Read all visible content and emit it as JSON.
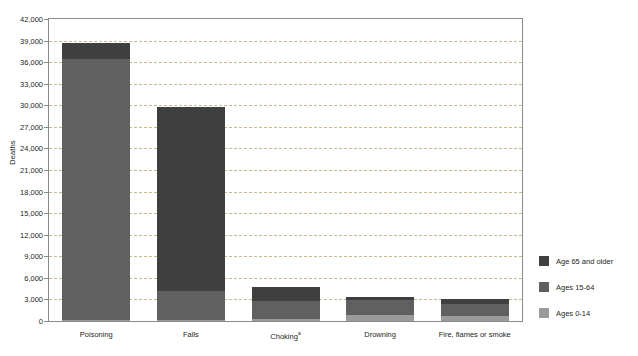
{
  "chart_data": {
    "type": "bar",
    "subtype": "stacked-vertical",
    "title": "",
    "xlabel": "",
    "ylabel": "Deaths",
    "ylim": [
      0,
      42000
    ],
    "ytick_step": 3000,
    "ytick_labels": [
      "0",
      "3,000",
      "6,000",
      "9,000",
      "12,000",
      "15,000",
      "18,000",
      "21,000",
      "24,000",
      "27,000",
      "30,000",
      "33,000",
      "36,000",
      "39,000",
      "42,000"
    ],
    "grid": true,
    "grid_axis": "y",
    "grid_style": "dashed",
    "legend_position": "right",
    "categories": [
      "Poisoning",
      "Falls",
      "Choking",
      "Drowning",
      "Fire, flames or smoke"
    ],
    "category_footnotes": [
      "",
      "",
      "a",
      "",
      ""
    ],
    "series": [
      {
        "name": "Ages 0-14",
        "color": "#9a9a9a",
        "values": [
          150,
          100,
          250,
          900,
          700
        ]
      },
      {
        "name": "Ages 15-64",
        "color": "#606060",
        "values": [
          36250,
          4100,
          2550,
          2000,
          1650
        ]
      },
      {
        "name": "Age 65 and older",
        "color": "#3f3f3f",
        "values": [
          2300,
          25500,
          2000,
          500,
          750
        ]
      }
    ],
    "totals": [
      38700,
      29700,
      4800,
      3400,
      3100
    ]
  },
  "axis": {
    "y_title": "Deaths"
  },
  "legend": {
    "items": [
      {
        "label": "Age 65 and older",
        "color": "#3f3f3f"
      },
      {
        "label": "Ages 15-64",
        "color": "#606060"
      },
      {
        "label": "Ages 0-14",
        "color": "#9a9a9a"
      }
    ]
  },
  "colors": {
    "frame": "#8a8a8a",
    "grid": "#c9ba8e",
    "background": "#ffffff",
    "text": "#231f20"
  }
}
